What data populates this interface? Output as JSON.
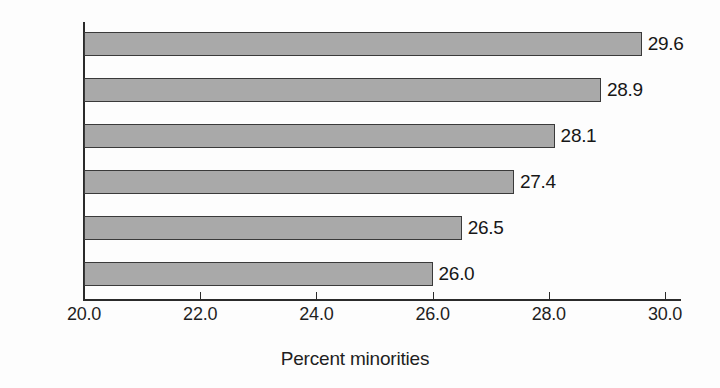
{
  "chart_data": {
    "type": "bar",
    "orientation": "horizontal",
    "title": "",
    "xlabel": "Percent minorities",
    "ylabel": "",
    "categories": [
      "2000",
      "1998",
      "1996",
      "1994",
      "1992",
      "1990"
    ],
    "values": [
      29.6,
      28.9,
      28.1,
      27.4,
      26.5,
      26.0
    ],
    "value_labels": [
      "29.6",
      "28.9",
      "28.1",
      "27.4",
      "26.5",
      "26.0"
    ],
    "xlim": [
      20.0,
      30.0
    ],
    "xticks": [
      20.0,
      22.0,
      24.0,
      26.0,
      28.0,
      30.0
    ],
    "xtick_labels": [
      "20.0",
      "22.0",
      "24.0",
      "26.0",
      "28.0",
      "30.0"
    ],
    "grid": false,
    "legend": false,
    "bar_color": "#a9a9a9",
    "bar_edge_color": "#3a3a3a",
    "axis_color": "#2b2b2b",
    "background": "#fdfdfd"
  }
}
